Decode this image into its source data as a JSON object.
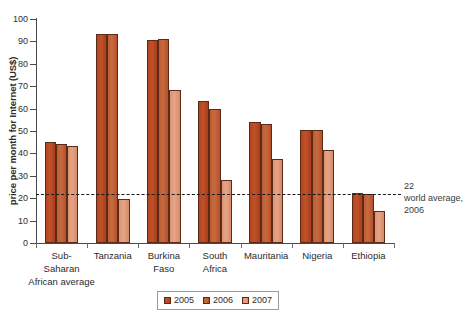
{
  "chart_data": {
    "type": "bar",
    "title": "",
    "xlabel": "",
    "ylabel": "price per month for Internet (US$)",
    "ylim": [
      0,
      100
    ],
    "yticks": [
      0,
      10,
      20,
      30,
      40,
      50,
      60,
      70,
      80,
      90,
      100
    ],
    "grid": false,
    "legend_position": "bottom-center",
    "categories": [
      "Sub-\nSaharan\nAfrican average",
      "Tanzania",
      "Burkina\nFaso",
      "South\nAfrica",
      "Mauritania",
      "Nigeria",
      "Ethiopia"
    ],
    "series": [
      {
        "name": "2005",
        "color": "#b4431f",
        "values": [
          45.2,
          93.5,
          90.5,
          63.5,
          54.0,
          50.5,
          22.5
        ]
      },
      {
        "name": "2006",
        "color": "#bd5c33",
        "values": [
          44.3,
          93.5,
          91.3,
          59.8,
          53.0,
          50.5,
          22.0
        ]
      },
      {
        "name": "2007",
        "color": "#dd9474",
        "values": [
          43.2,
          19.5,
          68.2,
          28.2,
          37.5,
          41.5,
          14.5
        ]
      }
    ],
    "annotations": [
      {
        "type": "hline",
        "value": 22,
        "style": "dashed",
        "label_line1": "22",
        "label_line2": "world average,",
        "label_line3": "2006"
      }
    ]
  }
}
